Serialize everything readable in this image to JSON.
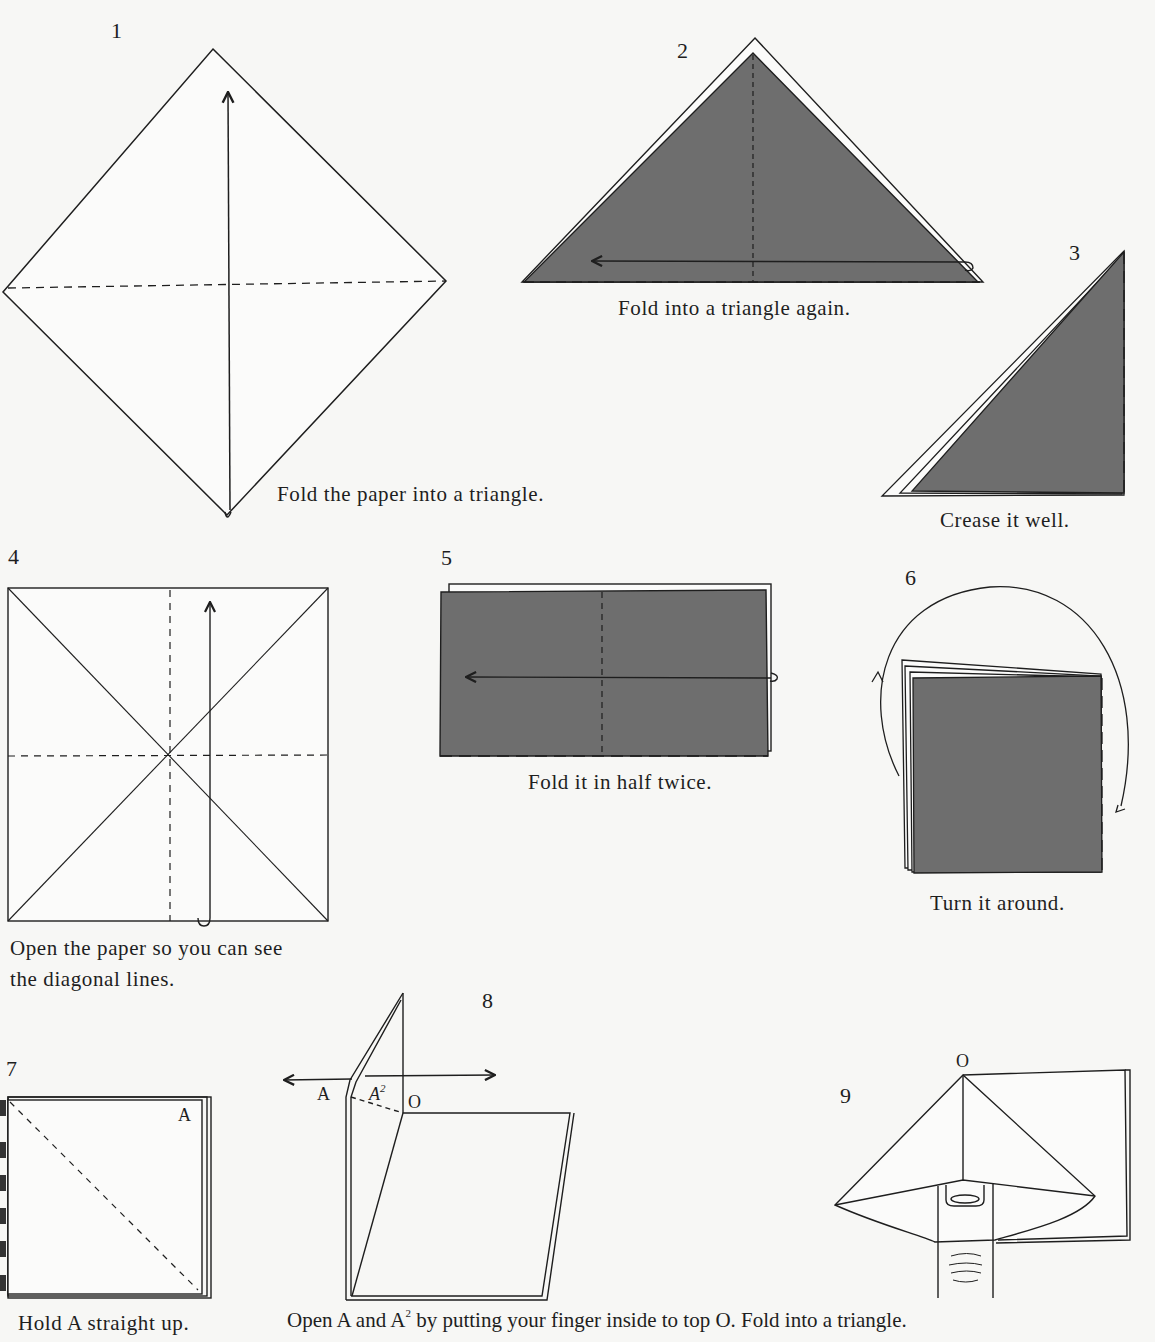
{
  "page": {
    "colors": {
      "paper": "#f7f7f5",
      "ink": "#1e1e1e",
      "shade": "#6e6e6e"
    }
  },
  "steps": [
    {
      "number": "1",
      "caption": "Fold the paper into a triangle."
    },
    {
      "number": "2",
      "caption": "Fold into a triangle again."
    },
    {
      "number": "3",
      "caption": "Crease it well."
    },
    {
      "number": "4",
      "caption_line1": "Open the paper so you can see",
      "caption_line2": "the diagonal lines."
    },
    {
      "number": "5",
      "caption": "Fold it in half twice."
    },
    {
      "number": "6",
      "caption": "Turn it around."
    },
    {
      "number": "7",
      "caption": "Hold A straight up.",
      "label_a": "A"
    },
    {
      "number": "8",
      "caption_part1": "Open A and A",
      "caption_sup": "2",
      "caption_part2": " by putting your finger inside to top O. Fold into a triangle.",
      "label_a": "A",
      "label_a2": "A",
      "label_a2_sup": "2",
      "label_o": "O"
    },
    {
      "number": "9",
      "label_o": "O"
    }
  ]
}
